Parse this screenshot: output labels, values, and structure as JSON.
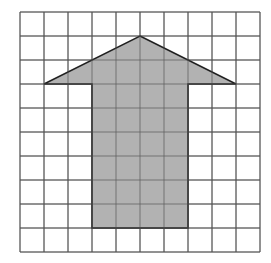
{
  "figure": {
    "grid": {
      "rows": 10,
      "cols": 10,
      "line_color": "#555555"
    },
    "arrow": {
      "fill": "#aaaaaa",
      "stroke": "#222222",
      "vertices_grid": [
        [
          5,
          1
        ],
        [
          9,
          3
        ],
        [
          7,
          3
        ],
        [
          7,
          9
        ],
        [
          3,
          9
        ],
        [
          3,
          3
        ],
        [
          1,
          3
        ]
      ]
    }
  }
}
